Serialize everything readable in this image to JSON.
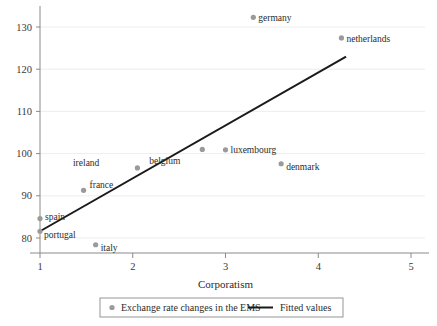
{
  "chart_data": {
    "type": "scatter",
    "title": "",
    "xlabel": "Corporatism",
    "ylabel": "",
    "xlim": [
      0.55,
      5.35
    ],
    "ylim": [
      76.0,
      135.5
    ],
    "xticks": [
      1,
      2,
      3,
      4,
      5
    ],
    "xtick_labels": [
      "1",
      "2",
      "3",
      "4",
      "5"
    ],
    "yticks": [
      80,
      90,
      100,
      110,
      120,
      130
    ],
    "ytick_labels": [
      "80",
      "90",
      "100",
      "110",
      "120",
      "130"
    ],
    "grid": "horizontal",
    "legend_position": "below-bottom-center",
    "series": [
      {
        "name": "Exchange rate changes in the EMS",
        "type": "scatter",
        "marker_color": "#9a9a9a",
        "points": [
          {
            "label": "portugal",
            "x": 1.0,
            "y": 81.6,
            "label_dx": 4,
            "label_dy": 4
          },
          {
            "label": "spain",
            "x": 1.0,
            "y": 84.6,
            "label_dx": 5,
            "label_dy": -2
          },
          {
            "label": "france",
            "x": 1.47,
            "y": 91.3,
            "label_dx": 6,
            "label_dy": -5
          },
          {
            "label": "italy",
            "x": 1.6,
            "y": 78.4,
            "label_dx": 5,
            "label_dy": 3
          },
          {
            "label": "ireland",
            "x": 2.05,
            "y": 96.6,
            "label_dx": -38,
            "label_dy": -5
          },
          {
            "label": "belgium",
            "x": 2.75,
            "y": 101.0,
            "label_dx": -22,
            "label_dy": 12
          },
          {
            "label": "luxembourg",
            "x": 3.0,
            "y": 100.9,
            "label_dx": 5,
            "label_dy": 0
          },
          {
            "label": "germany",
            "x": 3.3,
            "y": 132.3,
            "label_dx": 5,
            "label_dy": 1
          },
          {
            "label": "denmark",
            "x": 3.6,
            "y": 97.6,
            "label_dx": 5,
            "label_dy": 3
          },
          {
            "label": "netherlands",
            "x": 4.25,
            "y": 127.4,
            "label_dx": 5,
            "label_dy": 1
          }
        ]
      },
      {
        "name": "Fitted values",
        "type": "line",
        "line_color": "#1a1a1a",
        "x": [
          1.0,
          4.3
        ],
        "y": [
          81.6,
          123.0
        ]
      }
    ],
    "legend_entries": [
      {
        "label": "Exchange rate changes in the EMS",
        "marker": "circle",
        "color": "#9a9a9a"
      },
      {
        "label": "Fitted values",
        "marker": "line",
        "color": "#1a1a1a"
      }
    ]
  },
  "colors": {
    "marker": "#9a9a9a",
    "line": "#1a1a1a",
    "grid": "#e8e8e8",
    "axis": "#8a8a8a",
    "text": "#2b2b2b",
    "background": "#ffffff"
  }
}
